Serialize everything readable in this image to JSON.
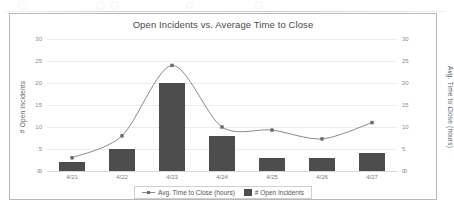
{
  "chart": {
    "title": "Open Incidents vs. Average Time to Close",
    "y_left_title": "# Open Incidents",
    "y_right_title": "Avg. Time to Close (hours)",
    "legend": {
      "line_label": "Avg. Time to Close (hours)",
      "bar_label": "# Open Incidents"
    },
    "colors": {
      "bar": "#4d4d4d",
      "line": "#8a8a90",
      "marker": "#6a6a70",
      "grid": "#ededf0",
      "frame": "#b7b7bd",
      "text": "#4d4d4d"
    }
  },
  "chart_data": {
    "type": "bar",
    "title": "Open Incidents vs. Average Time to Close",
    "xlabel": "",
    "ylabel": "# Open Incidents",
    "y2label": "Avg. Time to Close (hours)",
    "categories": [
      "4/21",
      "4/22",
      "4/23",
      "4/24",
      "4/25",
      "4/26",
      "4/27"
    ],
    "ylim": [
      0,
      30
    ],
    "y2lim": [
      0,
      30
    ],
    "yticks": [
      0,
      5,
      10,
      15,
      20,
      25,
      30
    ],
    "y2ticks": [
      0,
      5,
      10,
      15,
      20,
      25,
      30
    ],
    "grid": true,
    "legend_position": "bottom",
    "series": [
      {
        "name": "# Open Incidents",
        "type": "bar",
        "axis": "left",
        "values": [
          2,
          5,
          20,
          8,
          3,
          3,
          4
        ]
      },
      {
        "name": "Avg. Time to Close (hours)",
        "type": "line",
        "axis": "right",
        "smooth": true,
        "values": [
          3,
          8,
          24,
          10,
          9.3,
          7.3,
          11
        ]
      }
    ]
  }
}
